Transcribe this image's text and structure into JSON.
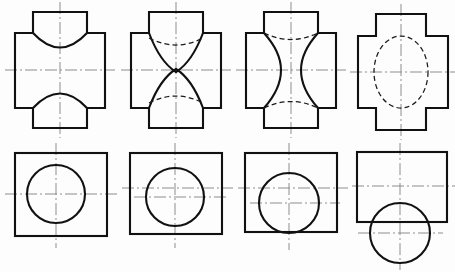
{
  "sheet": {
    "title": "Engineering Orthographic Projection Exercise Sheet",
    "description": "Eight technical drawing views arranged in two rows of four: top row shows front views of cross-shaped intersecting prism blocks with different intersection curves, bottom row shows corresponding top views of rectangular plates with circular holes in varying positions.",
    "width": 455,
    "height": 272,
    "background_color": "#fdfdfd",
    "line_color": "#111111",
    "hidden_line_color": "#1a1a1a",
    "centerline_color": "#8d8d8d"
  },
  "rows": [
    {
      "name": "top-row",
      "label": "Front views",
      "figures": [
        {
          "id": "fig-1-1",
          "label": "Cross block with concave circular intersection curves",
          "type": "front-view",
          "outline": "cross",
          "feature": "concave-arc",
          "hidden_lines": false,
          "geometry": {
            "cross_left": 15,
            "cross_right": 105,
            "cross_top": 12,
            "cross_bottom": 128,
            "arm_top": 33,
            "arm_bottom": 108,
            "stem_left": 33,
            "stem_right": 87,
            "center_x": 60,
            "center_y": 70
          }
        },
        {
          "id": "fig-1-2",
          "label": "Cross block with pointed V intersection curves and hidden arcs",
          "type": "front-view",
          "outline": "cross",
          "feature": "pointed-v",
          "hidden_lines": true,
          "geometry": {
            "cross_left": 131,
            "cross_right": 221,
            "cross_top": 12,
            "cross_bottom": 128,
            "arm_top": 33,
            "arm_bottom": 108,
            "stem_left": 149,
            "stem_right": 203,
            "center_x": 176,
            "center_y": 70
          }
        },
        {
          "id": "fig-1-3",
          "label": "Cross block with hourglass waisted intersection curves and hidden arcs",
          "type": "front-view",
          "outline": "cross",
          "feature": "hourglass",
          "hidden_lines": true,
          "geometry": {
            "cross_left": 246,
            "cross_right": 336,
            "cross_top": 12,
            "cross_bottom": 128,
            "arm_top": 33,
            "arm_bottom": 108,
            "stem_left": 264,
            "stem_right": 318,
            "center_x": 291,
            "center_y": 70
          }
        },
        {
          "id": "fig-1-4",
          "label": "Cross block with hidden ellipse representing cylindrical bore",
          "type": "front-view",
          "outline": "cross",
          "feature": "hidden-ellipse",
          "hidden_lines": true,
          "geometry": {
            "cross_left": 358,
            "cross_right": 448,
            "cross_top": 14,
            "cross_bottom": 130,
            "arm_top": 36,
            "arm_bottom": 108,
            "stem_left": 376,
            "stem_right": 426,
            "center_x": 401,
            "center_y": 72,
            "ellipse_rx": 27,
            "ellipse_ry": 36
          }
        }
      ]
    },
    {
      "name": "bottom-row",
      "label": "Top views",
      "figures": [
        {
          "id": "fig-2-1",
          "label": "Rectangular plate with centered circular hole",
          "type": "top-view",
          "outline": "rectangle",
          "feature": "circle-centered",
          "geometry": {
            "rect_left": 15,
            "rect_top": 153,
            "rect_right": 107,
            "rect_bottom": 236,
            "circle_cx": 56,
            "circle_cy": 194,
            "circle_r": 29
          }
        },
        {
          "id": "fig-2-2",
          "label": "Rectangular plate with circular hole offset right and below center",
          "type": "top-view",
          "outline": "rectangle",
          "feature": "circle-offset",
          "geometry": {
            "rect_left": 130,
            "rect_top": 153,
            "rect_right": 222,
            "rect_bottom": 234,
            "circle_cx": 175,
            "circle_cy": 197,
            "circle_r": 29
          }
        },
        {
          "id": "fig-2-3",
          "label": "Rectangular plate with circular hole tangent to bottom edge",
          "type": "top-view",
          "outline": "rectangle",
          "feature": "circle-tangent-bottom",
          "geometry": {
            "rect_left": 245,
            "rect_top": 153,
            "rect_right": 337,
            "rect_bottom": 232,
            "circle_cx": 289,
            "circle_cy": 203,
            "circle_r": 30
          }
        },
        {
          "id": "fig-2-4",
          "label": "Rectangular plate with circular boss projecting below bottom edge",
          "type": "top-view",
          "outline": "rectangle",
          "feature": "circle-projecting-below",
          "geometry": {
            "rect_left": 357,
            "rect_top": 152,
            "rect_right": 447,
            "rect_bottom": 222,
            "circle_cx": 400,
            "circle_cy": 233,
            "circle_r": 30
          }
        }
      ]
    }
  ]
}
